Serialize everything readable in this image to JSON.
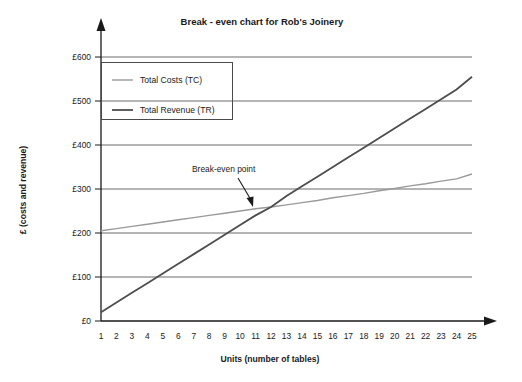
{
  "chart_data": {
    "type": "line",
    "title": "Break - even chart for Rob's Joinery",
    "xlabel": "Units (number of tables)",
    "ylabel": "£ (costs and revenue)",
    "xlim": [
      1,
      25
    ],
    "ylim": [
      0,
      600
    ],
    "grid": true,
    "legend_position": "top-left",
    "x": [
      1,
      2,
      3,
      4,
      5,
      6,
      7,
      8,
      9,
      10,
      11,
      12,
      13,
      14,
      15,
      16,
      17,
      18,
      19,
      20,
      21,
      22,
      23,
      24,
      25
    ],
    "xtick_labels": [
      "1",
      "2",
      "3",
      "4",
      "5",
      "6",
      "7",
      "8",
      "9",
      "10",
      "11",
      "12",
      "13",
      "14",
      "15",
      "16",
      "17",
      "18",
      "19",
      "20",
      "21",
      "22",
      "23",
      "24",
      "25"
    ],
    "ytick_labels": [
      "£0",
      "£100",
      "£200",
      "£300",
      "£400",
      "£500",
      "£600"
    ],
    "ytick_values": [
      0,
      100,
      200,
      300,
      400,
      500,
      600
    ],
    "series": [
      {
        "name": "Total Costs (TC)",
        "color": "#9a9a9a",
        "values": [
          205,
          210,
          215,
          220,
          225,
          230,
          235,
          240,
          245,
          250,
          255,
          259,
          264,
          269,
          274,
          280,
          285,
          290,
          296,
          301,
          307,
          312,
          318,
          323,
          334
        ]
      },
      {
        "name": "Total Revenue (TR)",
        "color": "#4d4d4d",
        "values": [
          20,
          42,
          64,
          86,
          108,
          130,
          152,
          174,
          196,
          218,
          240,
          259,
          284,
          306,
          328,
          350,
          372,
          394,
          416,
          438,
          460,
          482,
          504,
          526,
          555
        ]
      }
    ],
    "annotations": [
      {
        "label": "Break-even point",
        "x": 12,
        "y": 259
      }
    ]
  },
  "legend": {
    "items": [
      {
        "label": "Total Costs (TC)"
      },
      {
        "label": "Total Revenue (TR)"
      }
    ]
  }
}
